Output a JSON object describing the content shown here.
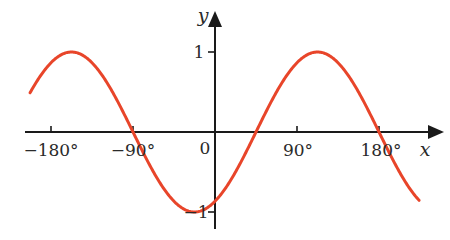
{
  "chart_data": {
    "type": "line",
    "title": "",
    "xlabel": "x",
    "ylabel": "y",
    "function": "y = -sin((4/3)(x + 90°))",
    "x_unit": "degrees",
    "xlim": [
      -203,
      224
    ],
    "ylim": [
      -1,
      1
    ],
    "grid": false,
    "legend": null,
    "x_ticks": [
      {
        "value": -180,
        "label": "−180°"
      },
      {
        "value": -90,
        "label": "−90°"
      },
      {
        "value": 0,
        "label": "0"
      },
      {
        "value": 90,
        "label": "90°"
      },
      {
        "value": 180,
        "label": "180°"
      }
    ],
    "y_ticks": [
      {
        "value": 1,
        "label": "1"
      },
      {
        "value": -1,
        "label": "−1"
      }
    ],
    "key_points": [
      {
        "x": -157.5,
        "y": 1,
        "note": "maximum"
      },
      {
        "x": -90,
        "y": 0,
        "note": "zero"
      },
      {
        "x": -22.5,
        "y": -1,
        "note": "minimum"
      },
      {
        "x": 45,
        "y": 0,
        "note": "zero"
      },
      {
        "x": 112.5,
        "y": 1,
        "note": "maximum"
      },
      {
        "x": 180,
        "y": 0,
        "note": "zero"
      }
    ],
    "series": [
      {
        "name": "curve",
        "color": "#e8452a",
        "x_range": [
          -203,
          224
        ]
      }
    ]
  },
  "labels": {
    "x_axis": "x",
    "y_axis": "y",
    "origin": "0",
    "tick_neg180": "−180°",
    "tick_neg90": "−90°",
    "tick_90": "90°",
    "tick_180": "180°",
    "tick_y1": "1",
    "tick_yneg1": "−1"
  }
}
